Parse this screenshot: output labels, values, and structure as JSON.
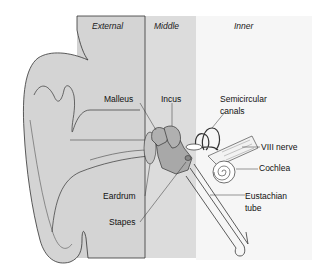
{
  "diagram": {
    "regions": [
      {
        "id": "external",
        "label": "External",
        "color": "#d2d2d2"
      },
      {
        "id": "middle",
        "label": "Middle",
        "color": "#dcdcdc"
      },
      {
        "id": "inner",
        "label": "Inner",
        "color": "#f7f7f7"
      }
    ],
    "labels": {
      "malleus": "Malleus",
      "incus": "Incus",
      "semicircular_line1": "Semicircular",
      "semicircular_line2": "canals",
      "nerve": "VIII nerve",
      "cochlea": "Cochlea",
      "eardrum": "Eardrum",
      "stapes": "Stapes",
      "eustachian_line1": "Eustachian",
      "eustachian_line2": "tube"
    },
    "colors": {
      "outline": "#333333",
      "ossicle_fill": "#a8a8a8",
      "ear_fill": "#d4d4d4"
    }
  }
}
